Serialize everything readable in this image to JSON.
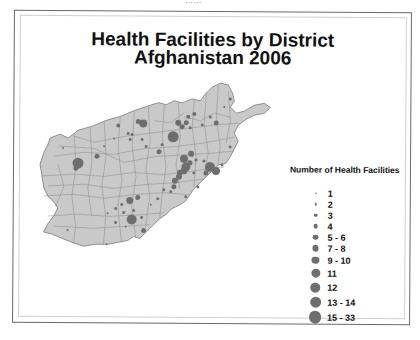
{
  "page": {
    "top_cut_text": "……"
  },
  "map": {
    "title_line1": "Health Facilities by District",
    "title_line2": "Afghanistan 2006",
    "colors": {
      "land_fill": "#c9c9c9",
      "district_border": "#8a8a8a",
      "symbol_fill": "#6e6e6e",
      "frame": "#6a6a6a"
    }
  },
  "legend": {
    "title": "Number of Health Facilities",
    "items": [
      {
        "label": "1",
        "size": 1.5
      },
      {
        "label": "2",
        "size": 2.5
      },
      {
        "label": "3",
        "size": 3.5
      },
      {
        "label": "4",
        "size": 4.5
      },
      {
        "label": "5 - 6",
        "size": 5.5
      },
      {
        "label": "7 - 8",
        "size": 6.5
      },
      {
        "label": "9 - 10",
        "size": 7.5
      },
      {
        "label": "11",
        "size": 9
      },
      {
        "label": "12",
        "size": 10
      },
      {
        "label": "13 - 14",
        "size": 11
      },
      {
        "label": "15 - 33",
        "size": 12.5
      }
    ]
  }
}
